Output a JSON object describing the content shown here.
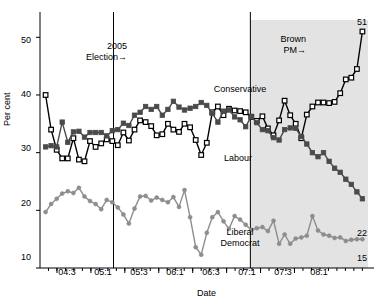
{
  "chart_data": {
    "type": "line",
    "title": "",
    "xlabel": "Date",
    "ylabel": "Per cent",
    "ylim": [
      10,
      53
    ],
    "xlim": [
      0,
      58
    ],
    "yticks": [
      10,
      20,
      30,
      40,
      50
    ],
    "xtick_labels": [
      "04:3",
      "05:1",
      "05:3",
      "06:1",
      "06:3",
      "07:1",
      "07:3",
      "08:1"
    ],
    "xtick_positions": [
      3,
      9,
      15,
      21,
      27,
      33,
      39,
      45
    ],
    "grid": false,
    "legend": "inline-labels",
    "annotations": [
      {
        "name": "election-2005",
        "text": "2005\nElection",
        "line_x": 13.0
      },
      {
        "name": "brown-pm",
        "text": "Brown\nPM",
        "line_x": 37.2
      }
    ],
    "shaded_region": {
      "from": 37.2,
      "to": 58,
      "color": "#e3e3e3",
      "label": "recession-shading"
    },
    "end_labels": [
      {
        "series": "Conservative",
        "value": 51
      },
      {
        "series": "Labour",
        "value": 22
      },
      {
        "series": "Liberal Democrat",
        "value": 15
      }
    ],
    "series": [
      {
        "name": "Conservative",
        "color": "#000000",
        "marker": "open-square",
        "values": [
          40.0,
          34.0,
          30.5,
          29.0,
          29.0,
          32.5,
          28.8,
          28.5,
          32.0,
          31.0,
          31.6,
          32.3,
          32.0,
          31.3,
          33.5,
          32.1,
          34.0,
          35.6,
          35.3,
          34.6,
          33.0,
          33.2,
          35.0,
          34.0,
          33.6,
          35.0,
          34.4,
          32.2,
          29.6,
          31.7,
          37.0,
          38.0,
          36.5,
          37.6,
          37.3,
          37.2,
          37.0,
          36.2,
          35.5,
          36.3,
          34.2,
          33.0,
          35.6,
          39.0,
          36.5,
          35.0,
          32.5,
          36.6,
          38.0,
          38.7,
          38.7,
          38.6,
          38.8,
          40.3,
          42.7,
          43.0,
          44.5,
          51.0
        ]
      },
      {
        "name": "Labour",
        "color": "#4a4a4a",
        "marker": "filled-square",
        "values": [
          31.0,
          31.2,
          31.0,
          35.3,
          31.8,
          33.6,
          33.7,
          32.7,
          33.5,
          33.5,
          33.5,
          32.9,
          33.8,
          34.0,
          35.1,
          34.7,
          36.5,
          37.0,
          38.0,
          37.5,
          38.0,
          36.5,
          37.5,
          38.9,
          37.9,
          37.4,
          37.7,
          38.0,
          38.7,
          38.2,
          36.8,
          35.3,
          37.2,
          37.4,
          36.2,
          35.7,
          34.5,
          36.3,
          35.2,
          34.0,
          33.8,
          32.6,
          32.2,
          34.0,
          34.3,
          34.2,
          32.8,
          31.5,
          30.0,
          29.3,
          30.0,
          28.5,
          27.3,
          26.6,
          25.4,
          24.5,
          23.2,
          22.0
        ]
      },
      {
        "name": "Liberal Democrat",
        "color": "#8d8d8d",
        "marker": "filled-circle",
        "values": [
          19.7,
          21.1,
          22.0,
          22.9,
          23.3,
          23.0,
          23.9,
          22.4,
          21.6,
          21.1,
          20.2,
          21.8,
          21.4,
          20.5,
          19.3,
          17.7,
          20.3,
          22.4,
          22.5,
          21.7,
          22.2,
          21.8,
          21.4,
          22.3,
          20.6,
          23.5,
          18.8,
          13.6,
          12.3,
          16.1,
          18.8,
          19.7,
          18.1,
          16.8,
          19.0,
          18.4,
          17.5,
          16.6,
          16.9,
          17.1,
          16.4,
          18.2,
          14.2,
          15.8,
          14.2,
          15.1,
          15.3,
          15.6,
          19.0,
          16.5,
          15.8,
          15.6,
          15.2,
          15.3,
          14.7,
          14.9,
          15.0,
          15.0
        ]
      }
    ]
  },
  "labels": {
    "ylabel": "Per cent",
    "xlabel": "Date",
    "conservative": "Conservative",
    "labour": "Labour",
    "libdem_line1": "Liberal",
    "libdem_line2": "Democrat",
    "election_line1": "2005",
    "election_line2": "Election",
    "brown_line1": "Brown",
    "brown_line2": "PM",
    "arrow": "→",
    "end_con": "51",
    "end_lab": "22",
    "end_ld": "15"
  },
  "yticks": [
    "50",
    "40",
    "30",
    "20",
    "10"
  ],
  "xticks": [
    "04:3",
    "05:1",
    "05:3",
    "06:1",
    "06:3",
    "07:1",
    "07:3",
    "08:1"
  ]
}
